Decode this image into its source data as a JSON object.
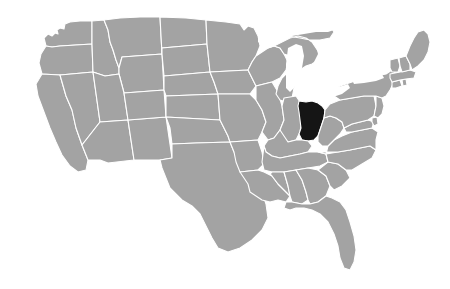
{
  "map": {
    "title": "United States map with Ohio highlighted",
    "type": "choropleth-locator",
    "background_color": "#ffffff",
    "default_state_color": "#a3a3a3",
    "highlight_color": "#151515",
    "border_color": "#ffffff",
    "water_color": "#ffffff",
    "highlighted_states": [
      "OH"
    ],
    "labels_visible": false,
    "states": [
      {
        "code": "WA",
        "name": "Washington",
        "highlighted": false
      },
      {
        "code": "OR",
        "name": "Oregon",
        "highlighted": false
      },
      {
        "code": "CA",
        "name": "California",
        "highlighted": false
      },
      {
        "code": "NV",
        "name": "Nevada",
        "highlighted": false
      },
      {
        "code": "ID",
        "name": "Idaho",
        "highlighted": false
      },
      {
        "code": "MT",
        "name": "Montana",
        "highlighted": false
      },
      {
        "code": "WY",
        "name": "Wyoming",
        "highlighted": false
      },
      {
        "code": "UT",
        "name": "Utah",
        "highlighted": false
      },
      {
        "code": "AZ",
        "name": "Arizona",
        "highlighted": false
      },
      {
        "code": "NM",
        "name": "New Mexico",
        "highlighted": false
      },
      {
        "code": "CO",
        "name": "Colorado",
        "highlighted": false
      },
      {
        "code": "ND",
        "name": "North Dakota",
        "highlighted": false
      },
      {
        "code": "SD",
        "name": "South Dakota",
        "highlighted": false
      },
      {
        "code": "NE",
        "name": "Nebraska",
        "highlighted": false
      },
      {
        "code": "KS",
        "name": "Kansas",
        "highlighted": false
      },
      {
        "code": "OK",
        "name": "Oklahoma",
        "highlighted": false
      },
      {
        "code": "TX",
        "name": "Texas",
        "highlighted": false
      },
      {
        "code": "MN",
        "name": "Minnesota",
        "highlighted": false
      },
      {
        "code": "IA",
        "name": "Iowa",
        "highlighted": false
      },
      {
        "code": "MO",
        "name": "Missouri",
        "highlighted": false
      },
      {
        "code": "AR",
        "name": "Arkansas",
        "highlighted": false
      },
      {
        "code": "LA",
        "name": "Louisiana",
        "highlighted": false
      },
      {
        "code": "WI",
        "name": "Wisconsin",
        "highlighted": false
      },
      {
        "code": "IL",
        "name": "Illinois",
        "highlighted": false
      },
      {
        "code": "MI",
        "name": "Michigan",
        "highlighted": false
      },
      {
        "code": "IN",
        "name": "Indiana",
        "highlighted": false
      },
      {
        "code": "OH",
        "name": "Ohio",
        "highlighted": true
      },
      {
        "code": "KY",
        "name": "Kentucky",
        "highlighted": false
      },
      {
        "code": "TN",
        "name": "Tennessee",
        "highlighted": false
      },
      {
        "code": "MS",
        "name": "Mississippi",
        "highlighted": false
      },
      {
        "code": "AL",
        "name": "Alabama",
        "highlighted": false
      },
      {
        "code": "GA",
        "name": "Georgia",
        "highlighted": false
      },
      {
        "code": "FL",
        "name": "Florida",
        "highlighted": false
      },
      {
        "code": "SC",
        "name": "South Carolina",
        "highlighted": false
      },
      {
        "code": "NC",
        "name": "North Carolina",
        "highlighted": false
      },
      {
        "code": "VA",
        "name": "Virginia",
        "highlighted": false
      },
      {
        "code": "WV",
        "name": "West Virginia",
        "highlighted": false
      },
      {
        "code": "MD",
        "name": "Maryland",
        "highlighted": false
      },
      {
        "code": "DE",
        "name": "Delaware",
        "highlighted": false
      },
      {
        "code": "PA",
        "name": "Pennsylvania",
        "highlighted": false
      },
      {
        "code": "NJ",
        "name": "New Jersey",
        "highlighted": false
      },
      {
        "code": "NY",
        "name": "New York",
        "highlighted": false
      },
      {
        "code": "CT",
        "name": "Connecticut",
        "highlighted": false
      },
      {
        "code": "RI",
        "name": "Rhode Island",
        "highlighted": false
      },
      {
        "code": "MA",
        "name": "Massachusetts",
        "highlighted": false
      },
      {
        "code": "VT",
        "name": "Vermont",
        "highlighted": false
      },
      {
        "code": "NH",
        "name": "New Hampshire",
        "highlighted": false
      },
      {
        "code": "ME",
        "name": "Maine",
        "highlighted": false
      }
    ],
    "water_bodies": [
      {
        "name": "Lake Superior"
      },
      {
        "name": "Lake Michigan"
      },
      {
        "name": "Lake Huron"
      },
      {
        "name": "Lake Erie"
      },
      {
        "name": "Lake Ontario"
      }
    ]
  }
}
